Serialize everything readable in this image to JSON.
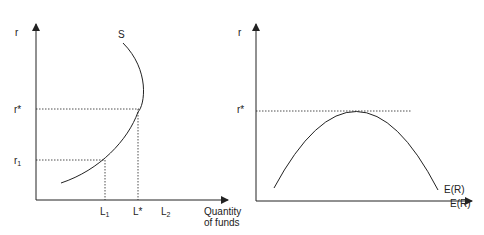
{
  "colors": {
    "line": "#222222",
    "background": "#ffffff"
  },
  "left_panel": {
    "y_axis_label": "r",
    "x_axis_label_line1": "Quantity",
    "x_axis_label_line2": "of funds",
    "curve_label": "S",
    "y_ticks": {
      "r_star": "r*",
      "r1_base": "r",
      "r1_sub": "1"
    },
    "x_ticks": {
      "L1_base": "L",
      "L1_sub": "1",
      "L_star": "L*",
      "L2_base": "L",
      "L2_sub": "2"
    }
  },
  "right_panel": {
    "y_axis_label": "r",
    "y_tick_r_star": "r*",
    "curve_label": "E(R)",
    "x_axis_label": "E(R)"
  }
}
